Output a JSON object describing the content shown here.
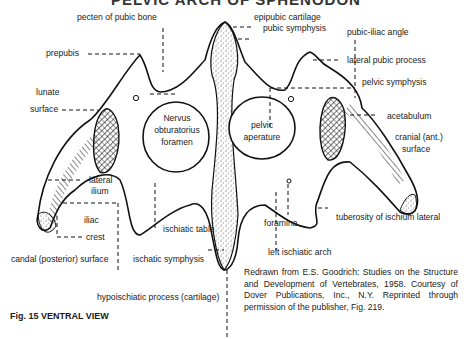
{
  "title": "PELVIC ARCH OF SPHENODON",
  "figure_caption": "Fig. 15 VENTRAL VIEW",
  "credit": "Redrawn from E.S. Goodrich: Studies on the Structure and Development of Vertebrates, 1958. Courtesy of Dover Publications, Inc., N.Y. Reprinted through permission of the publisher, Fig. 219.",
  "labels": {
    "pecten_of_pubic_bone": "pecten of pubic bone",
    "epipubic_cartilage": "epipubic cartilage",
    "pubic_symphysis": "pubic symphysis",
    "pubic_iliac_angle": "pubic-iliac angle",
    "prepubis": "prepubis",
    "lateral_pubic_process": "lateral pubic process",
    "pelvic_symphysis": "pelvic symphysis",
    "lunate": "lunate",
    "surface_left": "surface",
    "nervus": "Nervus",
    "obturatorius": "obturatorius",
    "foramen": "foramen",
    "pelvic": "pelvic",
    "aperature": "aperature",
    "acetabulum": "acetabulum",
    "cranial_ant": "cranial (ant.)",
    "surface_right": "surface",
    "lateral": "lateral",
    "ilium": "ilium",
    "iliac": "iliac",
    "crest": "crest",
    "ischiatic_table": "ischiatic table",
    "foramina": "foramina",
    "tuberosity": "tuberosity of ischium lateral",
    "left_ischiatic_arch": "left ischiatic arch",
    "candal_surface": "candal (posterior) surface",
    "ischatic_symphysis": "ischatic symphysis",
    "hypoischiatic": "hypoischiatic process (cartilage)"
  }
}
